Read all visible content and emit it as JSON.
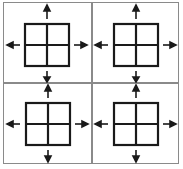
{
  "diagram": {
    "colors": {
      "frame": "#8a8a8a",
      "grid": "#1a1a1a",
      "arrow": "#1a1a1a",
      "background": "#ffffff"
    },
    "panels": [
      {
        "id": "top-left",
        "arrows": [
          "up",
          "down",
          "left",
          "right"
        ],
        "grid": "2x2"
      },
      {
        "id": "top-right",
        "arrows": [
          "up",
          "down",
          "left",
          "right"
        ],
        "grid": "2x2"
      },
      {
        "id": "bottom-left",
        "arrows": [
          "up",
          "down",
          "left",
          "right"
        ],
        "grid": "2x2"
      },
      {
        "id": "bottom-right",
        "arrows": [
          "up",
          "down",
          "left",
          "right"
        ],
        "grid": "2x2"
      }
    ]
  }
}
